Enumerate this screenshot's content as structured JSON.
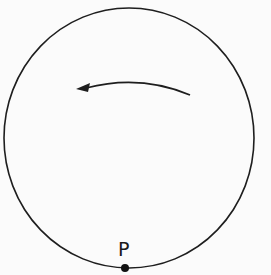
{
  "diagram": {
    "type": "circular-motion",
    "circle": {
      "cx": 129,
      "cy": 138,
      "r": 126,
      "stroke": "#1e1e1e"
    },
    "rotation_arrow": {
      "direction": "counterclockwise",
      "color": "#1e1e1e"
    },
    "point": {
      "label": "P",
      "x": 125,
      "y": 268,
      "color": "#111111"
    }
  }
}
